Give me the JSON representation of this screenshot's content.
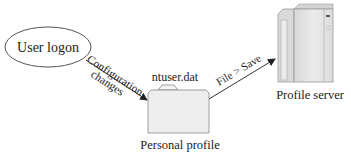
{
  "diagram": {
    "nodes": {
      "user_logon": {
        "label": "User logon"
      },
      "personal_profile": {
        "label": "Personal profile",
        "file_label": "ntuser.dat"
      },
      "profile_server": {
        "label": "Profile server"
      }
    },
    "edges": {
      "config": {
        "label_line1": "Configuration",
        "label_line2": "changes"
      },
      "save": {
        "label": "File > Save"
      }
    },
    "colors": {
      "stroke": "#333333",
      "folder_fill": "#eeeeee",
      "server_fill": "#e6e6e6",
      "server_dark": "#cfcfcf",
      "text": "#222222"
    }
  }
}
